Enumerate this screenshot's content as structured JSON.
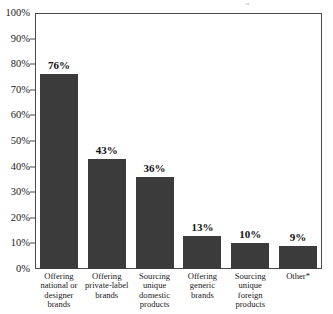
{
  "chart_data": {
    "type": "bar",
    "title": "",
    "xlabel": "",
    "ylabel": "",
    "categories": [
      "Offering national or designer brands",
      "Offering private-label brands",
      "Sourcing unique domestic products",
      "Offering generic brands",
      "Sourcing unique foreign products",
      "Other*"
    ],
    "values": [
      76,
      43,
      36,
      13,
      10,
      9
    ],
    "value_labels": [
      "76%",
      "43%",
      "36%",
      "13%",
      "10%",
      "9%"
    ],
    "ylim": [
      0,
      100
    ],
    "ytick_labels": [
      "100%",
      "90%",
      "80%",
      "70%",
      "60%",
      "50%",
      "40%",
      "30%",
      "20%",
      "10%",
      "0%"
    ],
    "ytick_values": [
      100,
      90,
      80,
      70,
      60,
      50,
      40,
      30,
      20,
      10,
      0
    ],
    "grid": false,
    "legend": false,
    "bar_color": "#3b3b3b",
    "axis_color": "#4a4a4a",
    "background_color": "#ffffff",
    "footnote_marker": "*"
  },
  "category_lines": [
    [
      "Offering",
      "national or",
      "designer",
      "brands"
    ],
    [
      "Offering",
      "private-label",
      "brands"
    ],
    [
      "Sourcing",
      "unique",
      "domestic",
      "products"
    ],
    [
      "Offering",
      "generic",
      "brands"
    ],
    [
      "Sourcing",
      "unique",
      "foreign",
      "products"
    ],
    [
      "Other*"
    ]
  ]
}
